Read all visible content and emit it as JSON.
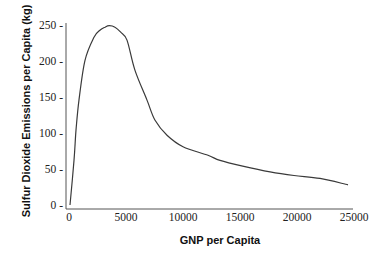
{
  "chart_data": {
    "type": "line",
    "title": "",
    "xlabel": "GNP per Capita",
    "ylabel": "Sulfur Dioxide Emissions per Capita (kg)",
    "xlim": [
      0,
      25000
    ],
    "ylim": [
      0,
      250
    ],
    "x_ticks": [
      0,
      5000,
      10000,
      15000,
      20000,
      25000
    ],
    "x_tick_labels": [
      "0",
      "5000",
      "10000",
      "15000",
      "20000",
      "25000"
    ],
    "y_ticks": [
      0,
      50,
      100,
      150,
      200,
      250
    ],
    "y_tick_labels": [
      "0 -",
      "50 -",
      "100 -",
      "150 -",
      "200 -",
      "250 -"
    ],
    "grid": false,
    "legend": null,
    "series": [
      {
        "name": "SO2 emissions (Environmental Kuznets Curve)",
        "color": "#3a3a3a",
        "x": [
          350,
          700,
          880,
          1140,
          1670,
          2460,
          3000,
          3420,
          3800,
          4300,
          4800,
          5350,
          6050,
          7100,
          7800,
          8860,
          10260,
          12460,
          13510,
          15500,
          17900,
          20000,
          22280,
          24740
        ],
        "y": [
          0,
          62,
          104,
          146,
          201,
          233,
          243,
          247,
          249,
          247,
          240,
          229,
          187,
          146,
          118,
          97,
          81,
          69,
          62,
          54,
          46,
          41,
          37,
          28
        ]
      }
    ]
  },
  "layout": {
    "plot": {
      "x0": 66,
      "x1": 353,
      "y0": 205,
      "y_top": 25,
      "x_axis_y": 209,
      "px_per_x": 0.0114,
      "px_per_y": 0.72
    }
  }
}
